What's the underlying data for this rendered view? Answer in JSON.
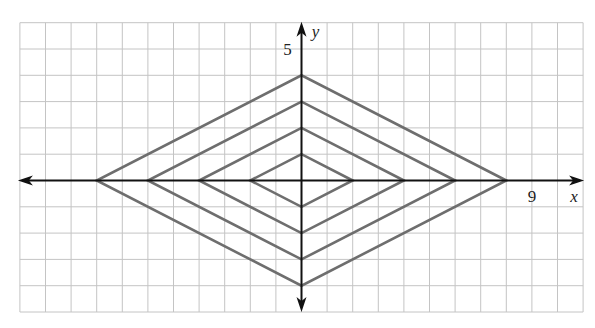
{
  "diagram": {
    "type": "coordinate-grid",
    "grid": {
      "x_min": -11,
      "x_max": 11,
      "y_min": -5,
      "y_max": 6,
      "step": 1,
      "color": "#c4c4c4"
    },
    "axes": {
      "color": "#111111",
      "x_label": "x",
      "y_label": "y",
      "x_tick_label": {
        "value": 9,
        "text": "9"
      },
      "y_tick_label": {
        "value": 5,
        "text": "5"
      }
    },
    "shape_color": "#6e6e6e",
    "shapes": [
      {
        "name": "diamond-1",
        "vertices": [
          [
            2,
            0
          ],
          [
            0,
            1
          ],
          [
            -2,
            0
          ],
          [
            0,
            -1
          ]
        ]
      },
      {
        "name": "diamond-2",
        "vertices": [
          [
            4,
            0
          ],
          [
            0,
            2
          ],
          [
            -4,
            0
          ],
          [
            0,
            -2
          ]
        ]
      },
      {
        "name": "diamond-3",
        "vertices": [
          [
            6,
            0
          ],
          [
            0,
            3
          ],
          [
            -6,
            0
          ],
          [
            0,
            -3
          ]
        ]
      },
      {
        "name": "diamond-4",
        "vertices": [
          [
            8,
            0
          ],
          [
            0,
            4
          ],
          [
            -8,
            0
          ],
          [
            0,
            -4
          ]
        ]
      }
    ]
  }
}
